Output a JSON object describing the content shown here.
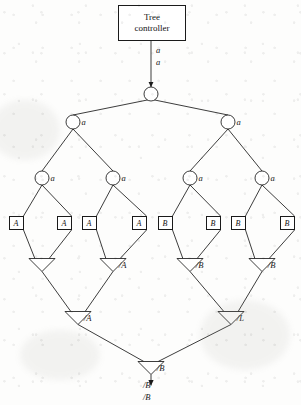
{
  "figure": {
    "type": "tree-diagram"
  },
  "controller": {
    "line1": "Tree",
    "line2": "controller"
  },
  "root_edge_labels": {
    "upper": "a",
    "lower": "a"
  },
  "output_labels": {
    "upper": "/B",
    "lower": "/B"
  },
  "circle_nodes": [
    {
      "id": "root",
      "label": "",
      "x": 151,
      "y": 94,
      "level": 1
    },
    {
      "id": "L2-1",
      "label": "a",
      "x": 73,
      "y": 122,
      "level": 2
    },
    {
      "id": "L2-2",
      "label": "a",
      "x": 228,
      "y": 122,
      "level": 2
    },
    {
      "id": "L3-1",
      "label": "a",
      "x": 42,
      "y": 178,
      "level": 3
    },
    {
      "id": "L3-2",
      "label": "a",
      "x": 113,
      "y": 178,
      "level": 3
    },
    {
      "id": "L3-3",
      "label": "a",
      "x": 190,
      "y": 178,
      "level": 3
    },
    {
      "id": "L3-4",
      "label": "a",
      "x": 262,
      "y": 178,
      "level": 3
    }
  ],
  "leaf_boxes": [
    {
      "id": "leaf-1",
      "label": "A",
      "x": 16,
      "y": 223
    },
    {
      "id": "leaf-2",
      "label": "A",
      "x": 64,
      "y": 223
    },
    {
      "id": "leaf-3",
      "label": "A",
      "x": 89,
      "y": 223
    },
    {
      "id": "leaf-4",
      "label": "A",
      "x": 139,
      "y": 223
    },
    {
      "id": "leaf-5",
      "label": "B",
      "x": 165,
      "y": 223
    },
    {
      "id": "leaf-6",
      "label": "B",
      "x": 213,
      "y": 223
    },
    {
      "id": "leaf-7",
      "label": "B",
      "x": 238,
      "y": 223
    },
    {
      "id": "leaf-8",
      "label": "B",
      "x": 287,
      "y": 223
    }
  ],
  "triangle_nodes": [
    {
      "id": "tri-1",
      "label": "",
      "x": 42,
      "y": 265,
      "level": 5
    },
    {
      "id": "tri-2",
      "label": "/A",
      "x": 113,
      "y": 265,
      "level": 5
    },
    {
      "id": "tri-3",
      "label": "/B",
      "x": 190,
      "y": 265,
      "level": 5
    },
    {
      "id": "tri-4",
      "label": "/B",
      "x": 262,
      "y": 265,
      "level": 5
    },
    {
      "id": "tri-5",
      "label": "/A",
      "x": 78,
      "y": 318,
      "level": 6
    },
    {
      "id": "tri-6",
      "label": "/L",
      "x": 231,
      "y": 318,
      "level": 6
    },
    {
      "id": "tri-7",
      "label": "/B",
      "x": 151,
      "y": 368,
      "level": 7
    }
  ],
  "colors": {
    "stroke": "#1a1a1a",
    "text": "#131313",
    "background": "#fdfdfc"
  }
}
